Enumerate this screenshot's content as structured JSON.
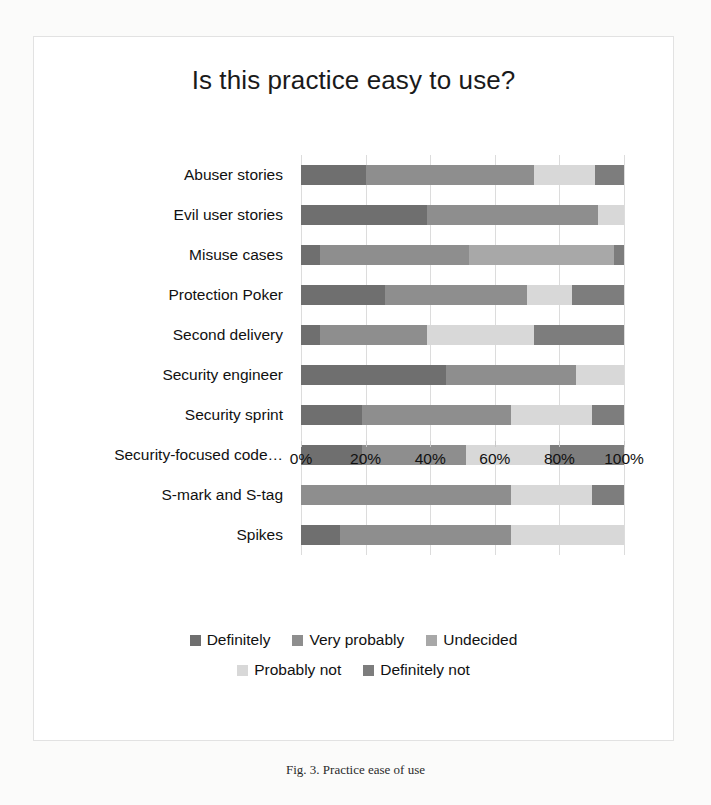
{
  "figure": {
    "caption": "Fig. 3. Practice ease of use"
  },
  "chart_data": {
    "type": "bar",
    "orientation": "horizontal",
    "stacked": true,
    "normalized_percent": true,
    "title": "Is this practice easy to use?",
    "xlabel": "",
    "ylabel": "",
    "xlim": [
      0,
      100
    ],
    "xticks": [
      0,
      20,
      40,
      60,
      80,
      100
    ],
    "xtick_labels": [
      "0%",
      "20%",
      "40%",
      "60%",
      "80%",
      "100%"
    ],
    "grid": true,
    "legend_position": "bottom",
    "categories": [
      "Abuser stories",
      "Evil user stories",
      "Misuse cases",
      "Protection Poker",
      "Second delivery",
      "Security engineer",
      "Security sprint",
      "Security-focused code…",
      "S-mark and S-tag",
      "Spikes"
    ],
    "series": [
      {
        "name": "Definitely",
        "color": "#6f6f6f",
        "values": [
          20,
          39,
          6,
          26,
          6,
          45,
          19,
          19,
          0,
          12
        ]
      },
      {
        "name": "Very probably",
        "color": "#8e8e8e",
        "values": [
          52,
          53,
          46,
          44,
          33,
          40,
          46,
          32,
          65,
          53
        ]
      },
      {
        "name": "Undecided",
        "color": "#a8a8a8",
        "values": [
          0,
          0,
          45,
          0,
          0,
          0,
          0,
          0,
          0,
          0
        ]
      },
      {
        "name": "Probably not",
        "color": "#d8d8d8",
        "values": [
          19,
          8,
          0,
          14,
          33,
          15,
          25,
          26,
          25,
          35
        ]
      },
      {
        "name": "Definitely not",
        "color": "#7d7d7d",
        "values": [
          9,
          0,
          3,
          16,
          28,
          0,
          10,
          23,
          10,
          0
        ]
      }
    ],
    "legend": [
      {
        "label": "Definitely",
        "color": "#6f6f6f"
      },
      {
        "label": "Very probably",
        "color": "#8e8e8e"
      },
      {
        "label": "Undecided",
        "color": "#a8a8a8"
      },
      {
        "label": "Probably not",
        "color": "#d8d8d8"
      },
      {
        "label": "Definitely not",
        "color": "#7d7d7d"
      }
    ]
  }
}
